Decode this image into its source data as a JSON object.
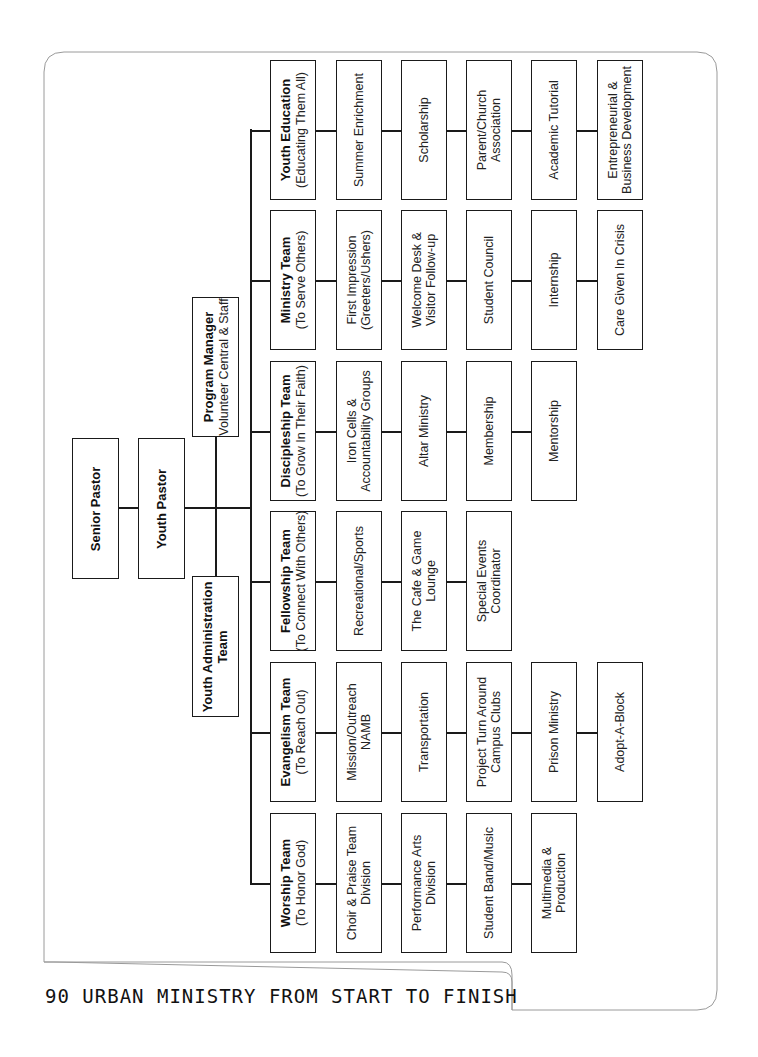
{
  "leadership": {
    "senior_pastor": "Senior Pastor",
    "youth_pastor": "Youth Pastor",
    "youth_admin": [
      "Youth Administration",
      "Team"
    ],
    "program_manager": {
      "title": "Program Manager",
      "subtitle": "Volunteer Central & Staff"
    }
  },
  "teams": [
    {
      "title": "Youth Education",
      "subtitle": "(Educating Them All)",
      "items": [
        [
          "Summer Enrichment"
        ],
        [
          "Scholarship"
        ],
        [
          "Parent/Church",
          "Association"
        ],
        [
          "Academic Tutorial"
        ],
        [
          "Entrepreneurial &",
          "Business Development"
        ]
      ]
    },
    {
      "title": "Ministry Team",
      "subtitle": "(To Serve Others)",
      "items": [
        [
          "First Impression",
          "(Greeters/Ushers)"
        ],
        [
          "Welcome Desk &",
          "Visitor Follow-up"
        ],
        [
          "Student Council"
        ],
        [
          "Internship"
        ],
        [
          "Care Given In Crisis"
        ]
      ]
    },
    {
      "title": "Discipleship Team",
      "subtitle": "(To Grow In Their Faith)",
      "items": [
        [
          "Iron Cells &",
          "Accountability Groups"
        ],
        [
          "Altar Ministry"
        ],
        [
          "Membership"
        ],
        [
          "Mentorship"
        ]
      ]
    },
    {
      "title": "Fellowship Team",
      "subtitle": "(To Connect With Others)",
      "items": [
        [
          "Recreational/Sports"
        ],
        [
          "The Cafe & Game",
          "Lounge"
        ],
        [
          "Special Events",
          "Coordinator"
        ]
      ]
    },
    {
      "title": "Evangelism Team",
      "subtitle": "(To Reach Out)",
      "items": [
        [
          "Mission/Outreach",
          "NAMB"
        ],
        [
          "Transportation"
        ],
        [
          "Project Turn Around",
          "Campus Clubs"
        ],
        [
          "Prison Ministry"
        ],
        [
          "Adopt-A-Block"
        ]
      ]
    },
    {
      "title": "Worship Team",
      "subtitle": "(To Honor God)",
      "items": [
        [
          "Choir & Praise Team",
          "Division"
        ],
        [
          "Performance Arts",
          "Division"
        ],
        [
          "Student Band/Music"
        ],
        [
          "Multimedia &",
          "Production"
        ]
      ]
    }
  ],
  "footer": {
    "page_number": "90",
    "book_title": "URBAN MINISTRY FROM START TO FINISH"
  }
}
